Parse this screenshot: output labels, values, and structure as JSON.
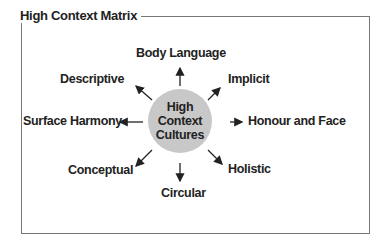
{
  "title": "High Context Matrix",
  "center": {
    "lines": [
      "High",
      "Context",
      "Cultures"
    ],
    "fill": "#c8c8c8"
  },
  "nodes": {
    "top": "Body Language",
    "top_right": "Implicit",
    "right": "Honour and Face",
    "bottom_right": "Holistic",
    "bottom": "Circular",
    "bottom_left": "Conceptual",
    "left": "Surface Harmony",
    "top_left": "Descriptive"
  }
}
